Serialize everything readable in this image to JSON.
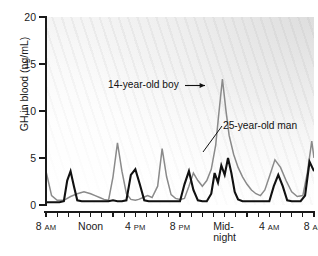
{
  "chart_data": {
    "type": "line",
    "title": "",
    "xlabel": "",
    "ylabel": "GH in blood (ng/mL)",
    "ylim": [
      0,
      20
    ],
    "yticks": [
      0,
      5,
      10,
      15,
      20
    ],
    "ytick_labels": [
      "0",
      "5",
      "10",
      "15",
      "20"
    ],
    "grid": false,
    "legend_position": "inline-annotations",
    "x_axis": {
      "start_hour": 8,
      "total_hours": 24,
      "tick_interval_hours": 1,
      "labeled_ticks": [
        {
          "hour_offset": 0,
          "line1": "8",
          "ampm": "AM",
          "line2": ""
        },
        {
          "hour_offset": 4,
          "line1": "Noon",
          "ampm": "",
          "line2": ""
        },
        {
          "hour_offset": 8,
          "line1": "4",
          "ampm": "PM",
          "line2": ""
        },
        {
          "hour_offset": 12,
          "line1": "8",
          "ampm": "PM",
          "line2": ""
        },
        {
          "hour_offset": 16,
          "line1": "Mid-",
          "ampm": "",
          "line2": "night"
        },
        {
          "hour_offset": 20,
          "line1": "4",
          "ampm": "AM",
          "line2": ""
        },
        {
          "hour_offset": 24,
          "line1": "8",
          "ampm": "AM",
          "line2": ""
        }
      ]
    },
    "annotations": [
      {
        "text": "14-year-old boy",
        "target_series": "14-year-old boy",
        "style": "arrow"
      },
      {
        "text": "25-year-old man",
        "target_series": "25-year-old man",
        "style": "leader-line"
      }
    ],
    "series": [
      {
        "name": "14-year-old boy",
        "color": "#8a8a8a",
        "line_width": 1.5,
        "x": [
          0.0,
          0.5,
          1.0,
          1.6,
          2.2,
          2.8,
          3.4,
          4.0,
          4.4,
          4.8,
          5.2,
          5.6,
          6.0,
          6.4,
          6.8,
          7.2,
          7.6,
          8.0,
          8.3,
          8.7,
          9.1,
          9.5,
          10.0,
          10.4,
          10.8,
          11.2,
          11.6,
          12.0,
          12.4,
          12.8,
          13.2,
          13.6,
          14.0,
          14.4,
          14.8,
          15.2,
          15.5,
          15.8,
          16.1,
          16.4,
          16.8,
          17.2,
          17.6,
          18.0,
          18.4,
          18.8,
          19.2,
          19.6,
          20.0,
          20.5,
          21.0,
          21.5,
          22.0,
          22.5,
          23.0,
          23.4,
          23.8,
          24.0
        ],
        "y": [
          3.6,
          1.0,
          0.5,
          0.5,
          0.9,
          1.2,
          1.4,
          1.2,
          1.0,
          0.8,
          0.6,
          0.5,
          3.0,
          6.6,
          3.6,
          1.2,
          0.6,
          0.5,
          0.6,
          0.8,
          1.0,
          0.8,
          2.0,
          6.0,
          3.0,
          1.1,
          0.7,
          0.6,
          0.7,
          2.0,
          3.4,
          2.6,
          2.0,
          2.6,
          3.8,
          6.4,
          10.0,
          13.4,
          10.2,
          7.4,
          5.4,
          4.0,
          3.0,
          2.2,
          1.6,
          1.2,
          1.0,
          1.6,
          3.0,
          4.8,
          4.0,
          2.6,
          1.4,
          0.9,
          1.0,
          3.4,
          6.8,
          5.0
        ]
      },
      {
        "name": "25-year-old man",
        "color": "#111111",
        "line_width": 2.1,
        "x": [
          0.0,
          0.4,
          0.8,
          1.2,
          1.6,
          1.9,
          2.2,
          2.5,
          2.8,
          3.2,
          3.6,
          4.0,
          4.4,
          4.8,
          5.2,
          5.6,
          6.0,
          6.4,
          6.8,
          7.2,
          7.6,
          8.0,
          8.4,
          8.8,
          9.2,
          9.6,
          10.0,
          10.4,
          10.8,
          11.2,
          11.6,
          12.0,
          12.4,
          12.8,
          13.2,
          13.6,
          14.0,
          14.4,
          14.8,
          15.1,
          15.4,
          15.7,
          16.0,
          16.3,
          16.6,
          16.9,
          17.2,
          17.6,
          18.0,
          18.4,
          18.8,
          19.2,
          19.6,
          20.0,
          20.4,
          20.8,
          21.2,
          21.6,
          22.0,
          22.4,
          22.8,
          23.2,
          23.6,
          24.0
        ],
        "y": [
          0.3,
          0.3,
          0.3,
          0.3,
          0.4,
          2.6,
          3.6,
          2.0,
          0.5,
          0.4,
          0.4,
          0.4,
          0.4,
          0.4,
          0.4,
          0.4,
          0.5,
          0.4,
          0.4,
          0.5,
          3.2,
          3.8,
          2.2,
          0.5,
          0.4,
          0.4,
          0.4,
          0.4,
          0.4,
          0.4,
          0.4,
          0.4,
          2.2,
          3.6,
          1.6,
          0.5,
          0.4,
          0.4,
          1.2,
          3.4,
          2.4,
          4.2,
          3.2,
          5.0,
          3.4,
          1.4,
          0.6,
          0.4,
          0.4,
          0.4,
          0.4,
          0.4,
          0.4,
          0.4,
          2.0,
          3.2,
          2.0,
          0.5,
          0.4,
          0.4,
          0.4,
          1.0,
          4.6,
          3.6
        ]
      }
    ]
  }
}
